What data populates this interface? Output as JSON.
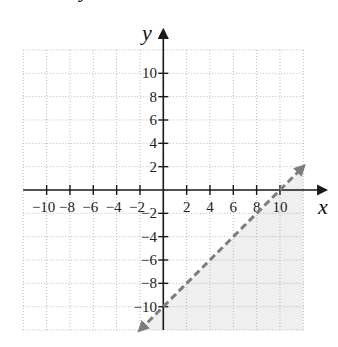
{
  "top_fragment": "y",
  "chart_data": {
    "type": "line",
    "title": "",
    "xlabel": "x",
    "ylabel": "y",
    "xlim": [
      -12,
      12
    ],
    "ylim": [
      -12,
      12
    ],
    "grid": true,
    "grid_step": 2,
    "x_ticks": [
      -10,
      -8,
      -6,
      -4,
      -2,
      2,
      4,
      6,
      8,
      10
    ],
    "x_tick_labels": [
      "−10",
      "−8",
      "−6",
      "−4",
      "−2",
      "2",
      "4",
      "6",
      "8",
      "10"
    ],
    "y_ticks": [
      10,
      8,
      6,
      4,
      2,
      -2,
      -4,
      -6,
      -8,
      -10
    ],
    "y_tick_labels": [
      "10",
      "8",
      "6",
      "4",
      "2",
      "−2",
      "−4",
      "−6",
      "−8",
      "−10"
    ],
    "series": [
      {
        "name": "boundary y = x − 10",
        "style": "dashed",
        "color": "#7d7d7d",
        "x": [
          -2,
          12
        ],
        "y": [
          -12,
          2
        ],
        "arrows": "both"
      }
    ],
    "shaded_region": {
      "description": "y < x − 10 (below/right of dashed line)",
      "color": "#efefef",
      "polygon": [
        [
          -2,
          -12
        ],
        [
          12,
          2
        ],
        [
          12,
          -12
        ]
      ]
    }
  }
}
